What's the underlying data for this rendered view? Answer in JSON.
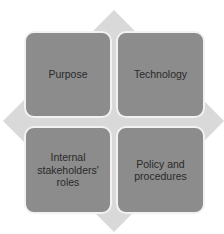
{
  "diagram": {
    "type": "matrix-2x2-on-diamond",
    "colors": {
      "diamond": "#d9d9d9",
      "box_fill": "#8c8c8c",
      "box_border": "#f2f2f2",
      "text": "#2a2a2a",
      "background": "#ffffff"
    },
    "quadrants": [
      {
        "position": "top-left",
        "label": "Purpose"
      },
      {
        "position": "top-right",
        "label": "Technology"
      },
      {
        "position": "bottom-left",
        "label": "Internal stakeholders' roles"
      },
      {
        "position": "bottom-right",
        "label": "Policy and procedures"
      }
    ]
  }
}
